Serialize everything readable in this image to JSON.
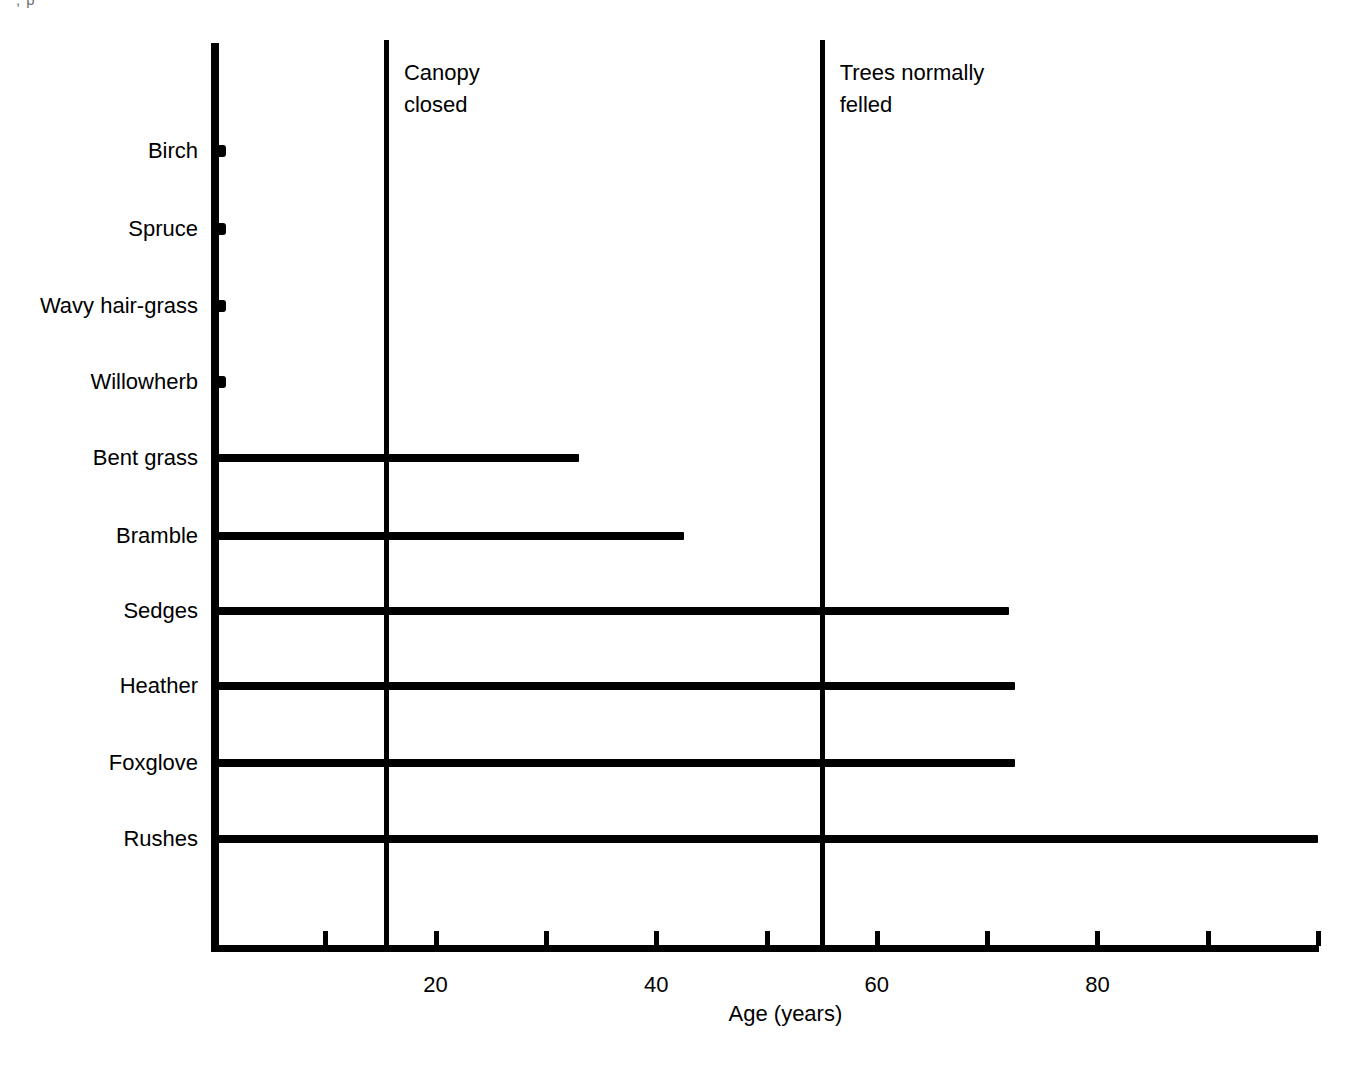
{
  "figure": {
    "top_fragment": ", p",
    "x_axis_title": "Age (years)"
  },
  "chart_data": {
    "type": "bar",
    "orientation": "horizontal",
    "title": "",
    "subtitle": "",
    "xlabel": "Age (years)",
    "ylabel": "",
    "xlim": [
      0,
      100
    ],
    "ylim": [
      0,
      11
    ],
    "grid": false,
    "legend": null,
    "x_major_ticks": [
      20,
      40,
      60,
      80
    ],
    "x_major_tick_labels": [
      "20",
      "40",
      "60",
      "80"
    ],
    "x_minor_ticks": [
      10,
      30,
      50,
      70,
      90,
      100
    ],
    "categories": [
      "Birch",
      "Spruce",
      "Wavy hair-grass",
      "Willowherb",
      "Bent grass",
      "Bramble",
      "Sedges",
      "Heather",
      "Foxglove",
      "Rushes"
    ],
    "values": [
      0,
      0,
      0,
      0,
      33,
      42.5,
      72,
      72.5,
      72.5,
      100
    ],
    "value_units": "years",
    "bars": [
      {
        "label": "Birch",
        "start": 0,
        "end": 0,
        "kind": "stub"
      },
      {
        "label": "Spruce",
        "start": 0,
        "end": 0,
        "kind": "stub"
      },
      {
        "label": "Wavy hair-grass",
        "start": 0,
        "end": 0,
        "kind": "stub"
      },
      {
        "label": "Willowherb",
        "start": 0,
        "end": 0,
        "kind": "stub"
      },
      {
        "label": "Bent grass",
        "start": 0,
        "end": 33,
        "kind": "bar"
      },
      {
        "label": "Bramble",
        "start": 0,
        "end": 42.5,
        "kind": "bar"
      },
      {
        "label": "Sedges",
        "start": 0,
        "end": 72,
        "kind": "bar"
      },
      {
        "label": "Heather",
        "start": 0,
        "end": 72.5,
        "kind": "bar"
      },
      {
        "label": "Foxglove",
        "start": 0,
        "end": 72.5,
        "kind": "bar"
      },
      {
        "label": "Rushes",
        "start": 0,
        "end": 100,
        "kind": "bar"
      }
    ],
    "annotations": [
      {
        "name": "canopy-closed",
        "text": "Canopy\nclosed",
        "x": 15.5
      },
      {
        "name": "trees-felled",
        "text": "Trees normally\nfelled",
        "x": 55.0
      }
    ],
    "colors": {
      "bar": "#000000",
      "axis": "#000000",
      "background": "#ffffff"
    }
  }
}
